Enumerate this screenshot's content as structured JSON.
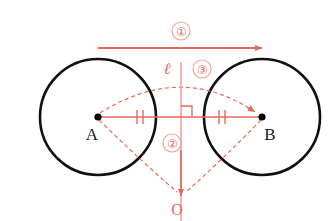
{
  "figure": {
    "colors": {
      "circle_stroke": "#111111",
      "construction": "#e8685d",
      "construction_light": "#f0a39c",
      "point_fill": "#000000",
      "background": "#ffffff"
    }
  },
  "points": [
    {
      "id": "A",
      "label": "A",
      "x": 98,
      "y": 117,
      "label_x": 92,
      "label_y": 140
    },
    {
      "id": "B",
      "label": "B",
      "x": 262,
      "y": 117,
      "label_x": 268,
      "label_y": 140
    },
    {
      "id": "O",
      "label": "O",
      "x": 181,
      "y": 196,
      "label_x": 172,
      "label_y": 214
    }
  ],
  "circles": [
    {
      "id": "circle-A",
      "center_x": 98,
      "center_y": 117,
      "radius": 58
    },
    {
      "id": "circle-B",
      "center_x": 262,
      "center_y": 117,
      "radius": 58
    }
  ],
  "line_label": {
    "text": "ℓ",
    "x": 167,
    "y": 72
  },
  "step_labels": [
    {
      "id": "step-1",
      "text": "①",
      "x": 181,
      "y": 36
    },
    {
      "id": "step-2",
      "text": "②",
      "x": 172,
      "y": 148
    },
    {
      "id": "step-3",
      "text": "③",
      "x": 202,
      "y": 74
    }
  ],
  "segments": {
    "top_arrow": {
      "x1": 98,
      "y1": 48,
      "x2": 262,
      "y2": 48
    },
    "axis_AB": {
      "x1": 98,
      "y1": 117,
      "x2": 262,
      "y2": 117
    },
    "line_ell": {
      "x1": 181,
      "y1": 62,
      "x2": 181,
      "y2": 221
    },
    "ell_arrow_tip_y": 196
  },
  "tick_marks": [
    {
      "id": "tick-left",
      "x": 140,
      "y": 117,
      "count": 2
    },
    {
      "id": "tick-right",
      "x": 222,
      "y": 117,
      "count": 2
    }
  ],
  "right_angle": {
    "x": 181,
    "y": 117,
    "size": 11
  },
  "dashed_paths": [
    {
      "id": "arc-A-to-apex-to-B",
      "desc": "upper dashed arc from A over apex to B, arrowhead at B"
    },
    {
      "id": "arc-A-to-O",
      "desc": "dashed line from A down to O"
    },
    {
      "id": "arc-B-to-O",
      "desc": "dashed line from B down to O"
    }
  ]
}
